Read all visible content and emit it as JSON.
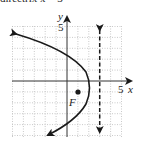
{
  "caption": "directrix x = 3",
  "graph": {
    "x_axis_label": "x",
    "y_axis_label": "y",
    "x_tick_label": "5",
    "y_tick_label": "5",
    "focus_label": "F",
    "focus": [
      1,
      -1
    ],
    "vertex": [
      2,
      -1
    ],
    "directrix_x": 3,
    "equation": "(y+1)^2 = -4(x-2)",
    "xlim": [
      -5,
      5
    ],
    "ylim": [
      -5,
      5
    ],
    "colors": {
      "curve": "#1a1a1a",
      "grid": "#bdbdbd",
      "axis": "#333333"
    }
  }
}
